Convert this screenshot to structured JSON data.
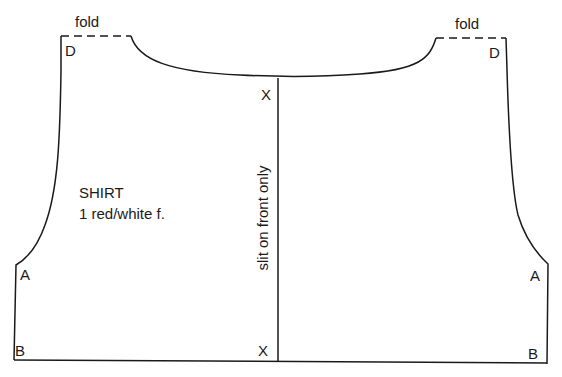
{
  "pattern": {
    "piece_name": "SHIRT",
    "piece_instruction": "1 red/white f.",
    "center_note": "slit on front only",
    "fold_labels": [
      "fold",
      "fold"
    ],
    "points": {
      "D_left": "D",
      "D_right": "D",
      "X_top": "X",
      "X_bottom": "X",
      "A_left": "A",
      "A_right": "A",
      "B_left": "B",
      "B_right": "B"
    },
    "line_color": "#1a1a1a",
    "background": "#ffffff"
  }
}
